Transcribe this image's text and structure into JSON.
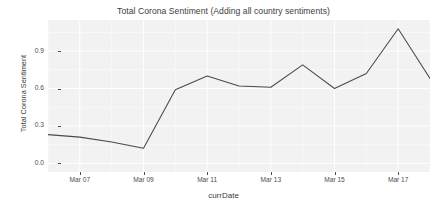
{
  "chart_data": {
    "type": "line",
    "title": "Total Corona Sentiment (Adding all country sentiments)",
    "xlabel": "currDate",
    "ylabel": "Total Corona Sentiment",
    "x": [
      "Mar 06",
      "Mar 07",
      "Mar 08",
      "Mar 09",
      "Mar 10",
      "Mar 11",
      "Mar 12",
      "Mar 13",
      "Mar 14",
      "Mar 15",
      "Mar 16",
      "Mar 17",
      "Mar 18"
    ],
    "values": [
      0.23,
      0.21,
      0.17,
      0.12,
      0.59,
      0.7,
      0.62,
      0.61,
      0.79,
      0.6,
      0.72,
      1.08,
      0.68
    ],
    "series": [
      {
        "name": "Total Corona Sentiment",
        "color": "#4a4a4a",
        "values": [
          0.23,
          0.21,
          0.17,
          0.12,
          0.59,
          0.7,
          0.62,
          0.61,
          0.79,
          0.6,
          0.72,
          1.08,
          0.68
        ]
      }
    ],
    "ytick_labels": [
      "0.0",
      "0.3",
      "0.6",
      "0.9"
    ],
    "ytick_values": [
      0.0,
      0.3,
      0.6,
      0.9
    ],
    "xtick_labels": [
      "Mar 07",
      "Mar 09",
      "Mar 11",
      "Mar 13",
      "Mar 15",
      "Mar 17"
    ],
    "xtick_values": [
      "Mar 07",
      "Mar 09",
      "Mar 11",
      "Mar 13",
      "Mar 15",
      "Mar 17"
    ],
    "xlim": [
      "Mar 06",
      "Mar 18"
    ],
    "ylim": [
      -0.07,
      1.15
    ],
    "grid": true,
    "grid_major_color": "#ffffff",
    "grid_minor_color": "#fafafa",
    "panel_background": "#f2f2f2",
    "plot_background": "#ffffff",
    "legend": "none",
    "legend_position": "none"
  }
}
